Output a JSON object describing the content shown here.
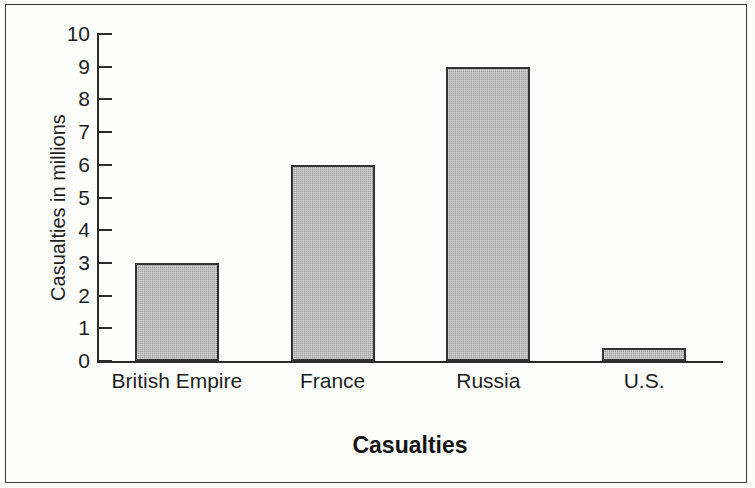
{
  "figure": {
    "background_color": "#fdfdfc",
    "border_color": "#3a3a3a"
  },
  "chart_data": {
    "type": "bar",
    "title": "",
    "categories": [
      "British Empire",
      "France",
      "Russia",
      "U.S."
    ],
    "values": [
      3.0,
      6.0,
      9.0,
      0.4
    ],
    "xlabel": "Casualties",
    "ylabel": "Casualties in millions",
    "ylim": [
      0,
      10
    ],
    "ytick_labels": [
      "0",
      "1",
      "2",
      "3",
      "4",
      "5",
      "6",
      "7",
      "8",
      "9",
      "10"
    ],
    "ytick_values": [
      0,
      1,
      2,
      3,
      4,
      5,
      6,
      7,
      8,
      9,
      10
    ],
    "grid": false,
    "legend": false,
    "legend_position": "none",
    "bar_fill_color": "#a9a9a9",
    "bar_edge_color": "#333333",
    "axis_color": "#2b2b2b",
    "tick_direction": "in"
  }
}
